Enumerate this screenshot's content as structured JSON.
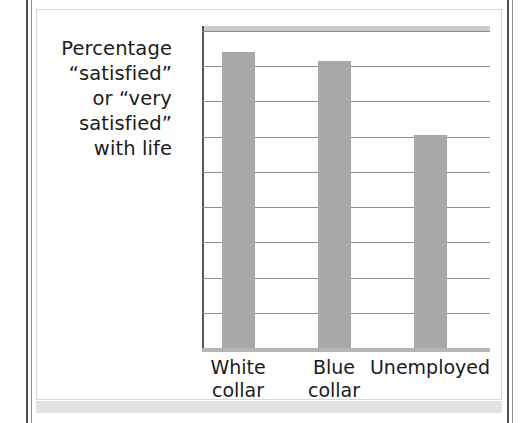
{
  "chart_data": {
    "type": "bar",
    "title": "",
    "subtitle": "",
    "xlabel": "",
    "ylabel": "Percentage “satisfied” or “very satisfied” with life",
    "ylabel_lines": [
      "Percentage",
      "“satisfied”",
      "or “very",
      "satisfied”",
      "with life"
    ],
    "categories": [
      "White collar",
      "Blue collar",
      "Unemployed"
    ],
    "category_lines": [
      [
        "White",
        "collar"
      ],
      [
        "Blue",
        "collar"
      ],
      [
        "Unemployed"
      ]
    ],
    "values": [
      84,
      81.5,
      60.5
    ],
    "ylim": [
      0,
      90
    ],
    "ytick_values": [
      0,
      10,
      20,
      30,
      40,
      50,
      60,
      70,
      80,
      90
    ],
    "ytick_labels": [
      "0",
      "10",
      "20",
      "30",
      "40",
      "50",
      "60",
      "70",
      "80",
      "90%"
    ],
    "grid": true,
    "legend": "none",
    "bar_color": "#a8a8a8",
    "gridline_color": "#8e8e8e",
    "axis_color": "#555555",
    "text_color": "#1b1b1b",
    "background_color": "#ffffff"
  }
}
